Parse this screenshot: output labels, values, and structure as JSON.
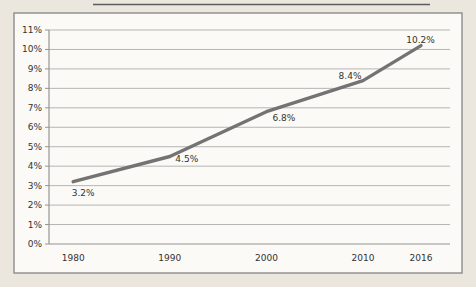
{
  "figure": {
    "kind": "scanned-line-chart",
    "page_background": "#ebe7df",
    "chart_background": "#fbfaf6",
    "border_color": "#8c8c8c",
    "artifact_color": "#4f4f4f"
  },
  "chart_data": {
    "type": "line",
    "title": "",
    "xlabel": "",
    "ylabel": "",
    "x": [
      1980,
      1990,
      2000,
      2010,
      2016
    ],
    "x_tick_labels": [
      "1980",
      "1990",
      "2000",
      "2010",
      "2016"
    ],
    "series": [
      {
        "name": "percentage-trend",
        "values": [
          3.2,
          4.5,
          6.8,
          8.4,
          10.2
        ],
        "point_labels": [
          "3.2%",
          "4.5%",
          "6.8%",
          "8.4%",
          "10.2%"
        ],
        "color": "#737373",
        "line_width": 3.4
      }
    ],
    "ylim": [
      0,
      11
    ],
    "xlim": [
      1977.5,
      2019
    ],
    "y_tick_step": 1,
    "y_tick_labels": [
      "0%",
      "1%",
      "2%",
      "3%",
      "4%",
      "5%",
      "6%",
      "7%",
      "8%",
      "9%",
      "10%",
      "11%"
    ],
    "grid": true,
    "legend": "none",
    "grid_color": "#b5b5b5",
    "axis_color": "#949494",
    "text_color": "#333333",
    "label_offsets": [
      [
        10,
        11.5
      ],
      [
        17,
        2.5
      ],
      [
        17.5,
        6
      ],
      [
        -13,
        -4.5
      ],
      [
        -0.5,
        -5.5
      ]
    ]
  }
}
